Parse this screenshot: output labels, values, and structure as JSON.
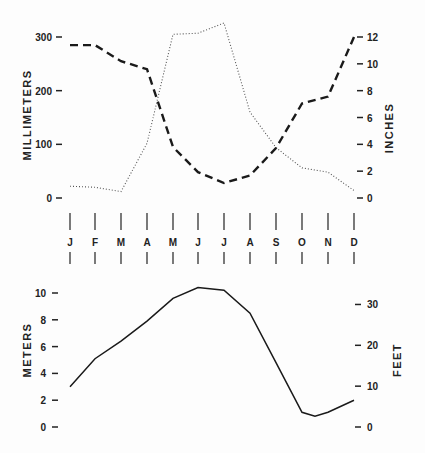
{
  "chart_data": [
    {
      "type": "line",
      "title": "",
      "categories": [
        "J",
        "F",
        "M",
        "A",
        "M",
        "J",
        "J",
        "A",
        "S",
        "O",
        "N",
        "D"
      ],
      "ylabel": "MILLIMETERS",
      "ylabel_right": "INCHES",
      "ylim": [
        0,
        300
      ],
      "ylim_right": [
        0,
        12
      ],
      "yticks": [
        0,
        100,
        200,
        300
      ],
      "yticks_right": [
        0,
        2,
        4,
        6,
        8,
        10,
        12
      ],
      "grid": false,
      "series": [
        {
          "name": "dashed",
          "style": "dashed",
          "values": [
            285,
            285,
            255,
            240,
            95,
            48,
            28,
            42,
            93,
            176,
            189,
            300
          ]
        },
        {
          "name": "dotted",
          "style": "dotted",
          "values": [
            22,
            20,
            12,
            102,
            305,
            307,
            326,
            160,
            94,
            56,
            48,
            14
          ]
        }
      ]
    },
    {
      "type": "line",
      "title": "",
      "categories": [
        "J",
        "F",
        "M",
        "A",
        "M",
        "J",
        "J",
        "A",
        "S",
        "O",
        "N",
        "D"
      ],
      "ylabel": "METERS",
      "ylabel_right": "FEET",
      "ylim": [
        0,
        10
      ],
      "ylim_right": [
        0,
        30
      ],
      "yticks": [
        0,
        2,
        4,
        6,
        8,
        10
      ],
      "yticks_right": [
        0,
        10,
        20,
        30
      ],
      "grid": false,
      "series": [
        {
          "name": "solid",
          "style": "solid",
          "values": [
            3.0,
            5.1,
            6.4,
            7.9,
            9.6,
            10.4,
            10.2,
            8.5,
            4.8,
            1.1,
            1.1,
            2.0
          ]
        }
      ]
    }
  ],
  "labels": {
    "top_left_axis": "MILLIMETERS",
    "top_right_axis": "INCHES",
    "bottom_left_axis": "METERS",
    "bottom_right_axis": "FEET",
    "months": [
      "J",
      "F",
      "M",
      "A",
      "M",
      "J",
      "J",
      "A",
      "S",
      "O",
      "N",
      "D"
    ]
  }
}
